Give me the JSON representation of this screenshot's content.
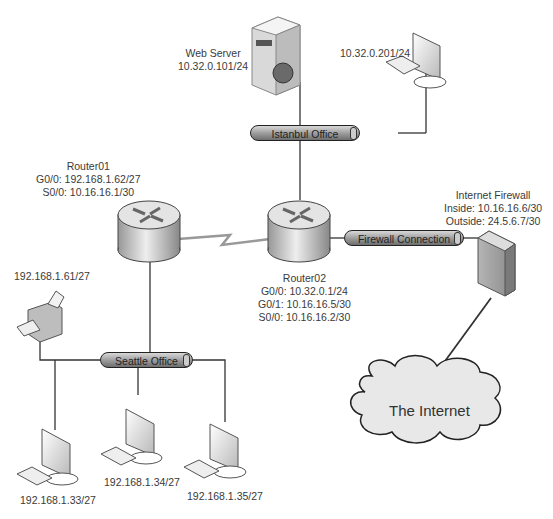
{
  "diagram": {
    "type": "network-topology",
    "nodes": {
      "web_server": {
        "name": "Web Server",
        "ip": "10.32.0.101/24"
      },
      "istanbul_pc": {
        "ip": "10.32.0.201/24"
      },
      "router01": {
        "name": "Router01",
        "g00": "G0/0:  192.168.1.62/27",
        "s00": "S0/0:  10.16.16.1/30"
      },
      "router02": {
        "name": "Router02",
        "g00": "G0/0:  10.32.0.1/24",
        "g01": "G0/1:  10.16.16.5/30",
        "s00": "S0/0:  10.16.16.2/30"
      },
      "firewall": {
        "name": "Internet Firewall",
        "inside": "Inside:  10.16.16.6/30",
        "outside": "Outside:  24.5.6.7/30"
      },
      "printer": {
        "ip": "192.168.1.61/27"
      },
      "pc1": {
        "ip": "192.168.1.33/27"
      },
      "pc2": {
        "ip": "192.168.1.34/27"
      },
      "pc3": {
        "ip": "192.168.1.35/27"
      },
      "internet": {
        "label": "The Internet"
      }
    },
    "segments": {
      "istanbul": "Istanbul Office",
      "seattle": "Seattle Office",
      "firewall_conn": "Firewall Connection"
    },
    "colors": {
      "line": "#333333",
      "device": "#cfcfcf",
      "cloud": "#e8e8e8"
    }
  }
}
